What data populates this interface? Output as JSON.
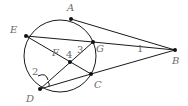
{
  "diagram": {
    "type": "circle-geometry",
    "circle": {
      "cx": 60,
      "cy": 56,
      "r": 36
    },
    "points": {
      "A": {
        "x": 71,
        "y": 19,
        "label": "A",
        "lx": 67,
        "ly": 11
      },
      "E": {
        "x": 26,
        "y": 36,
        "label": "E",
        "lx": 10,
        "ly": 33
      },
      "G": {
        "x": 93,
        "y": 42,
        "label": "G",
        "lx": 96,
        "ly": 52
      },
      "F": {
        "x": 70,
        "y": 62,
        "label": "F",
        "lx": 52,
        "ly": 56
      },
      "C": {
        "x": 91,
        "y": 74,
        "label": "C",
        "lx": 94,
        "ly": 88
      },
      "D": {
        "x": 40,
        "y": 89,
        "label": "D",
        "lx": 26,
        "ly": 102
      },
      "B": {
        "x": 175,
        "y": 50,
        "label": "B",
        "lx": 172,
        "ly": 64
      }
    },
    "segments": [
      [
        "A",
        "B"
      ],
      [
        "G",
        "B"
      ],
      [
        "C",
        "B"
      ],
      [
        "E",
        "G"
      ],
      [
        "E",
        "C"
      ],
      [
        "D",
        "G"
      ],
      [
        "D",
        "C"
      ]
    ],
    "angle_labels": {
      "one": {
        "text": "1",
        "x": 137,
        "y": 52
      },
      "two": {
        "text": "2",
        "x": 32,
        "y": 75
      },
      "three": {
        "text": "3",
        "x": 77,
        "y": 53
      },
      "four": {
        "text": "4",
        "x": 66,
        "y": 58
      }
    }
  }
}
